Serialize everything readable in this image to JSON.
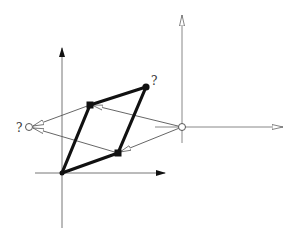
{
  "diagram": {
    "type": "vector-addition-projection",
    "colors": {
      "bold": "#111111",
      "thin": "#555555",
      "axis": "#777777",
      "background": "#ffffff"
    },
    "left_axes": {
      "origin": [
        62,
        173
      ],
      "vertical": {
        "from": [
          62,
          228
        ],
        "to": [
          62,
          48
        ],
        "arrow": "filled"
      },
      "horizontal": {
        "from": [
          35,
          173
        ],
        "to": [
          165,
          173
        ],
        "arrow": "filled"
      }
    },
    "right_axes": {
      "origin": [
        182,
        127
      ],
      "vertical": {
        "from": [
          182,
          143
        ],
        "to": [
          182,
          15
        ],
        "arrow": "open"
      },
      "horizontal": {
        "from": [
          155,
          127
        ],
        "to": [
          283,
          127
        ],
        "arrow": "open"
      }
    },
    "parallelogram": {
      "O": [
        62,
        173
      ],
      "A": [
        90,
        105
      ],
      "B": [
        118,
        153
      ],
      "C": [
        146,
        87
      ],
      "vertex_markers": {
        "A": "square",
        "B": "square",
        "C": "dot"
      }
    },
    "labels": {
      "sum_point": "?",
      "left_point": "?"
    },
    "points": {
      "right_circle": [
        182,
        127
      ],
      "left_circle": [
        30,
        127
      ]
    }
  }
}
